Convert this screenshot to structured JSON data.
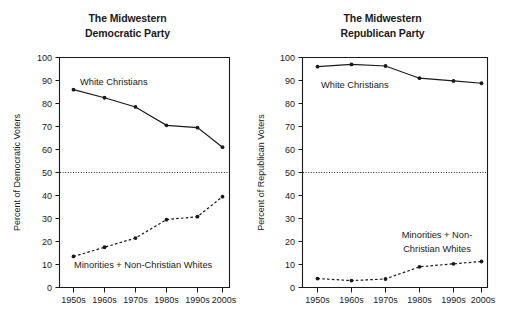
{
  "chart_data": [
    {
      "type": "line",
      "title": "The Midwestern Democratic Party",
      "title_line1": "The Midwestern",
      "title_line2": "Democratic Party",
      "xlabel": "",
      "ylabel": "Percent of Democratic Voters",
      "categories": [
        "1950s",
        "1960s",
        "1970s",
        "1980s",
        "1990s",
        "2000s"
      ],
      "ylim": [
        0,
        100
      ],
      "yticks": [
        0,
        10,
        20,
        30,
        40,
        50,
        60,
        70,
        80,
        90,
        100
      ],
      "grid": false,
      "legend_position": "inline-annotation",
      "reference_line": {
        "value": 50,
        "style": "dotted"
      },
      "series": [
        {
          "name": "White Christians",
          "style": "solid",
          "values": [
            86.0,
            82.5,
            78.5,
            70.5,
            69.5,
            61.0
          ],
          "annotation": "White Christians"
        },
        {
          "name": "Minorities + Non-Christian Whites",
          "style": "dashed",
          "values": [
            13.5,
            17.5,
            21.5,
            29.5,
            30.8,
            39.5
          ],
          "annotation": "Minorities + Non-Christian Whites"
        }
      ]
    },
    {
      "type": "line",
      "title": "The Midwestern Republican Party",
      "title_line1": "The Midwestern",
      "title_line2": "Republican Party",
      "xlabel": "",
      "ylabel": "Percent of Republican Voters",
      "categories": [
        "1950s",
        "1960s",
        "1970s",
        "1980s",
        "1990s",
        "2000s"
      ],
      "ylim": [
        0,
        100
      ],
      "yticks": [
        0,
        10,
        20,
        30,
        40,
        50,
        60,
        70,
        80,
        90,
        100
      ],
      "grid": false,
      "legend_position": "inline-annotation",
      "reference_line": {
        "value": 50,
        "style": "dotted"
      },
      "series": [
        {
          "name": "White Christians",
          "style": "solid",
          "values": [
            96.0,
            97.0,
            96.3,
            91.0,
            89.8,
            88.8
          ],
          "annotation": "White Christians"
        },
        {
          "name": "Minorities + Non-Christian Whites",
          "style": "dashed",
          "values": [
            3.9,
            3.0,
            3.7,
            9.0,
            10.3,
            11.3
          ],
          "annotation_line1": "Minorities + Non-",
          "annotation_line2": "Christian Whites"
        }
      ]
    }
  ],
  "colors": {
    "background": "#ffffff",
    "ink": "#1a1a1a"
  }
}
